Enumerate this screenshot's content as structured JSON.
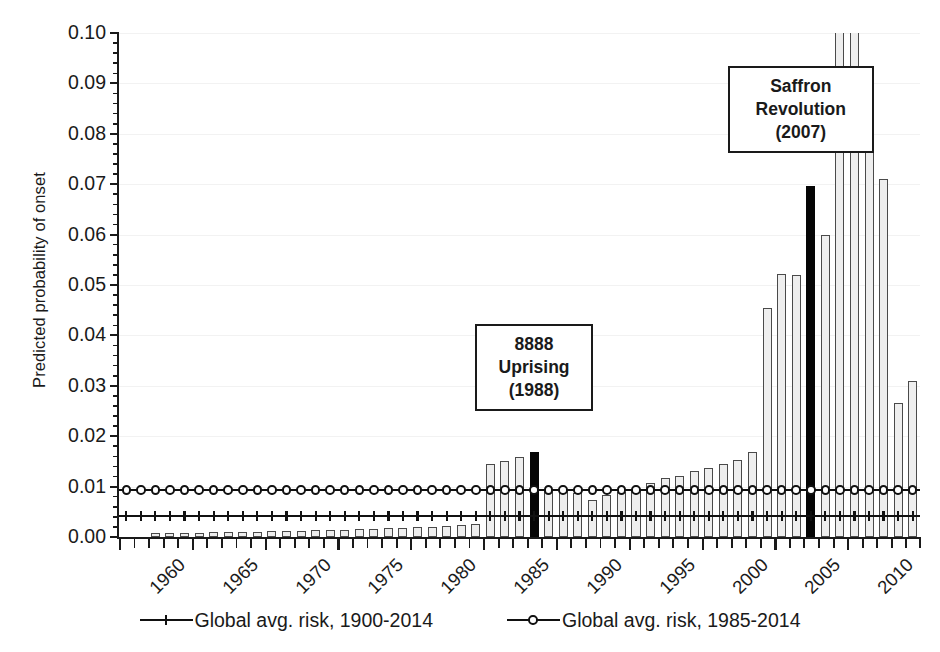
{
  "chart_data": {
    "type": "bar",
    "title": "",
    "subtitle": "",
    "xlabel": "",
    "ylabel": "Predicted probability of onset",
    "ylim": [
      0.0,
      0.1
    ],
    "ytick_labels": [
      "0.00",
      "0.01",
      "0.02",
      "0.03",
      "0.04",
      "0.05",
      "0.06",
      "0.07",
      "0.08",
      "0.09",
      "0.10"
    ],
    "ytick_values": [
      0.0,
      0.01,
      0.02,
      0.03,
      0.04,
      0.05,
      0.06,
      0.07,
      0.08,
      0.09,
      0.1
    ],
    "ytick_minor_step": 0.002,
    "xtick_labels": [
      "1960",
      "1965",
      "1970",
      "1975",
      "1980",
      "1985",
      "1990",
      "1995",
      "2000",
      "2005",
      "2010"
    ],
    "xtick_label_rotation": -45,
    "grid": "horizontal-faint",
    "legend_position": "below-axis",
    "bar_note": "Bars for 1960 and 1961 are effectively zero; 2009 and 2010 exceed the 0.10 axis maximum and are clipped at the top of the plot.",
    "categories": [
      1960,
      1961,
      1962,
      1963,
      1964,
      1965,
      1966,
      1967,
      1968,
      1969,
      1970,
      1971,
      1972,
      1973,
      1974,
      1975,
      1976,
      1977,
      1978,
      1979,
      1980,
      1981,
      1982,
      1983,
      1984,
      1985,
      1986,
      1987,
      1988,
      1989,
      1990,
      1991,
      1992,
      1993,
      1994,
      1995,
      1996,
      1997,
      1998,
      1999,
      2000,
      2001,
      2002,
      2003,
      2004,
      2005,
      2006,
      2007,
      2008,
      2009,
      2010,
      2011,
      2012,
      2013,
      2014
    ],
    "values": [
      0.0,
      0.0,
      0.0007,
      0.0008,
      0.0008,
      0.0008,
      0.0009,
      0.0009,
      0.001,
      0.001,
      0.0011,
      0.0011,
      0.0012,
      0.0013,
      0.0013,
      0.0014,
      0.0015,
      0.0016,
      0.0017,
      0.0018,
      0.0019,
      0.002,
      0.0022,
      0.0024,
      0.0026,
      0.0144,
      0.015,
      0.0158,
      0.0168,
      0.0095,
      0.0093,
      0.0087,
      0.0074,
      0.0084,
      0.009,
      0.0095,
      0.0107,
      0.0118,
      0.0122,
      0.0131,
      0.0137,
      0.0145,
      0.0153,
      0.0168,
      0.0455,
      0.0521,
      0.0519,
      0.0697,
      0.06,
      0.105,
      0.103,
      0.081,
      0.0711,
      0.0265,
      0.031
    ],
    "highlighted": [
      1988,
      2007
    ],
    "series": [
      {
        "name": "Global avg. risk, 1900-2014",
        "type": "line",
        "marker": "plus",
        "value": 0.0042
      },
      {
        "name": "Global avg. risk, 1985-2014",
        "type": "line",
        "marker": "circle",
        "value": 0.0093
      }
    ],
    "annotations": [
      {
        "id": "uprising-1988",
        "lines": [
          "8888",
          "Uprising",
          "(1988)"
        ],
        "points_to_year": 1988
      },
      {
        "id": "saffron-2007",
        "lines": [
          "Saffron",
          "Revolution",
          "(2007)"
        ],
        "points_to_year": 2007
      }
    ]
  },
  "axes": {
    "y_title": "Predicted probability of onset"
  },
  "legend": {
    "items": [
      {
        "label": "Global avg. risk, 1900-2014",
        "marker": "plus-marker"
      },
      {
        "label": "Global avg. risk, 1985-2014",
        "marker": "circle-marker"
      }
    ]
  },
  "annotations": {
    "uprising": {
      "l1": "8888",
      "l2": "Uprising",
      "l3": "(1988)"
    },
    "saffron": {
      "l1": "Saffron",
      "l2": "Revolution",
      "l3": "(2007)"
    }
  },
  "colors": {
    "bar_fill": "#eeeeee",
    "bar_edge": "#4a4a4a",
    "highlight": "#050505",
    "axis": "#1a1a1a",
    "grid": "#f2f2f2"
  }
}
